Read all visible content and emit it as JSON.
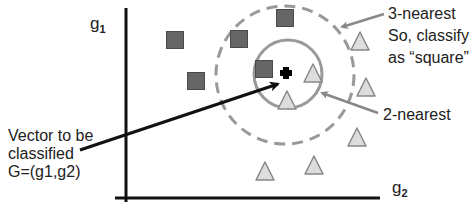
{
  "diagram": {
    "axes": {
      "y_label": "g",
      "y_label_sub": "1",
      "x_label": "g",
      "x_label_sub": "2"
    },
    "annotations": {
      "three_nearest": [
        "3-nearest",
        "So, classify",
        "as “square”"
      ],
      "two_nearest": "2-nearest",
      "query": [
        "Vector to be",
        "classified",
        "G=(g1,g2)"
      ]
    },
    "colors": {
      "square_fill": "#666666",
      "square_stroke": "#4a4a4a",
      "triangle_fill": "#dddddd",
      "triangle_stroke": "#888888",
      "circle_stroke": "#999999",
      "axis": "#111111",
      "arrow_gray": "#888888",
      "arrow_black": "#111111",
      "query_point": "#000000"
    },
    "squares": [
      {
        "x": 175,
        "y": 40
      },
      {
        "x": 196,
        "y": 81
      },
      {
        "x": 239,
        "y": 39
      },
      {
        "x": 285,
        "y": 18
      },
      {
        "x": 264,
        "y": 69
      }
    ],
    "triangles": [
      {
        "x": 313,
        "y": 73
      },
      {
        "x": 287,
        "y": 100
      },
      {
        "x": 360,
        "y": 41
      },
      {
        "x": 366,
        "y": 87
      },
      {
        "x": 357,
        "y": 137
      },
      {
        "x": 265,
        "y": 171
      },
      {
        "x": 314,
        "y": 165
      }
    ],
    "query_point": {
      "x": 286,
      "y": 73
    },
    "inner_circle": {
      "cx": 288,
      "cy": 74,
      "r": 34,
      "style": "solid",
      "label": "2-nearest"
    },
    "outer_circle": {
      "cx": 285,
      "cy": 75,
      "r": 69,
      "style": "dashed",
      "label": "3-nearest"
    }
  }
}
